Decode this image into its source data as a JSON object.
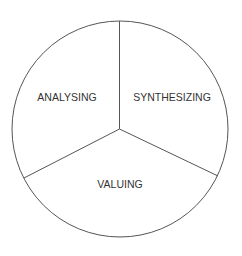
{
  "diagram": {
    "type": "three-segment-circle",
    "segments": [
      {
        "label": "ANALYSING",
        "position": "upper-left"
      },
      {
        "label": "SYNTHESIZING",
        "position": "upper-right"
      },
      {
        "label": "VALUING",
        "position": "bottom"
      }
    ],
    "colors": {
      "stroke": "#555555",
      "text": "#333333",
      "background": "#ffffff"
    }
  }
}
